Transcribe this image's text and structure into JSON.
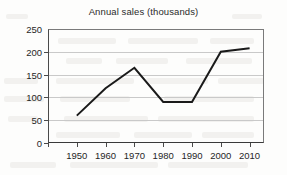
{
  "chart_data": {
    "type": "line",
    "title": "Annual sales (thousands)",
    "xlabel": "",
    "ylabel": "",
    "x": [
      1950,
      1960,
      1970,
      1980,
      1990,
      2000,
      2010
    ],
    "values": [
      60,
      120,
      165,
      90,
      90,
      200,
      208
    ],
    "series": [
      {
        "name": "Annual sales",
        "values": [
          60,
          120,
          165,
          90,
          90,
          200,
          208
        ],
        "color": "#1a1a1a"
      }
    ],
    "xlim": [
      1940,
      2015
    ],
    "ylim": [
      0,
      250
    ],
    "x_tick_labels": [
      "1950",
      "1960",
      "1970",
      "1980",
      "1990",
      "2000",
      "2010"
    ],
    "y_tick_labels": [
      "0",
      "50",
      "100",
      "150",
      "200",
      "250"
    ],
    "y_ticks": [
      0,
      50,
      100,
      150,
      200,
      250
    ],
    "grid": "horizontal",
    "legend": "none"
  },
  "axes": {
    "y_labels": [
      "250",
      "200",
      "150",
      "100",
      "50",
      "0"
    ],
    "x_labels": [
      "1950",
      "1960",
      "1970",
      "1980",
      "1990",
      "2000",
      "2010"
    ]
  },
  "colors": {
    "line": "#1a1a1a",
    "grid": "#c9c9c9",
    "axis": "#4a4a4a",
    "text": "#262626",
    "background": "#fdfdfc"
  }
}
